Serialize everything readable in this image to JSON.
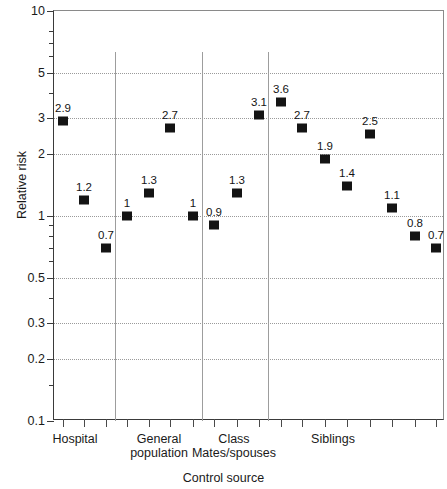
{
  "chart_data": {
    "type": "scatter",
    "title": "",
    "xlabel": "Control source",
    "ylabel": "Relative risk",
    "yscale": "log",
    "ylim": [
      0.1,
      10
    ],
    "yticks": [
      {
        "value": 10,
        "label": "10",
        "grid": false
      },
      {
        "value": 5,
        "label": "5",
        "grid": true
      },
      {
        "value": 3,
        "label": "3",
        "grid": true
      },
      {
        "value": 2,
        "label": "2",
        "grid": true
      },
      {
        "value": 1,
        "label": "1",
        "grid": true
      },
      {
        "value": 0.5,
        "label": "0.5",
        "grid": true
      },
      {
        "value": 0.3,
        "label": "0.3",
        "grid": true
      },
      {
        "value": 0.2,
        "label": "0.2",
        "grid": true
      },
      {
        "value": 0.1,
        "label": "0.1",
        "grid": false
      }
    ],
    "yminor_ticks": [
      8,
      7,
      6,
      4,
      0.9,
      0.8,
      0.7,
      0.6,
      0.4,
      0.15
    ],
    "grid": true,
    "legend": null,
    "groups": [
      {
        "name": "Hospital",
        "label": "Hospital",
        "n_points": 3,
        "label_x": 75,
        "boundary_x": 114
      },
      {
        "name": "General population",
        "label": "General\npopulation",
        "n_points": 3,
        "label_x": 159,
        "boundary_x": 201
      },
      {
        "name": "Class Mates/spouses",
        "label": "Class\nMates/spouses",
        "n_points": 3,
        "label_x": 234,
        "boundary_x": 267
      },
      {
        "name": "Siblings",
        "label": "Siblings",
        "n_points": 6,
        "label_x": 333,
        "boundary_x": null
      }
    ],
    "categories": [
      "Hospital",
      "Hospital",
      "Hospital",
      "General population",
      "General population",
      "General population",
      "Class Mates/spouses",
      "Class Mates/spouses",
      "Class Mates/spouses",
      "Siblings",
      "Siblings",
      "Siblings",
      "Siblings",
      "Siblings",
      "Siblings"
    ],
    "points": [
      {
        "group": "Hospital",
        "value": 2.9,
        "label": "2.9",
        "x": 62
      },
      {
        "group": "Hospital",
        "value": 1.2,
        "label": "1.2",
        "x": 83
      },
      {
        "group": "Hospital",
        "value": 0.7,
        "label": "0.7",
        "x": 105
      },
      {
        "group": "General population",
        "value": 1.0,
        "label": "1",
        "x": 126
      },
      {
        "group": "General population",
        "value": 1.3,
        "label": "1.3",
        "x": 148
      },
      {
        "group": "General population",
        "value": 2.7,
        "label": "2.7",
        "x": 169
      },
      {
        "group": "Class Mates/spouses",
        "value": 1.0,
        "label": "1",
        "x": 192
      },
      {
        "group": "Class Mates/spouses",
        "value": 0.9,
        "label": "0.9",
        "x": 213
      },
      {
        "group": "Class Mates/spouses",
        "value": 1.3,
        "label": "1.3",
        "x": 236
      },
      {
        "group": "Class Mates/spouses",
        "value": 3.1,
        "label": "3.1",
        "x": 258
      },
      {
        "group": "Siblings",
        "value": 3.6,
        "label": "3.6",
        "x": 280
      },
      {
        "group": "Siblings",
        "value": 2.7,
        "label": "2.7",
        "x": 301
      },
      {
        "group": "Siblings",
        "value": 1.9,
        "label": "1.9",
        "x": 324
      },
      {
        "group": "Siblings",
        "value": 1.4,
        "label": "1.4",
        "x": 346
      },
      {
        "group": "Siblings",
        "value": 2.5,
        "label": "2.5",
        "x": 369
      },
      {
        "group": "Siblings",
        "value": 1.1,
        "label": "1.1",
        "x": 391
      },
      {
        "group": "Siblings",
        "value": 0.8,
        "label": "0.8",
        "x": 414
      },
      {
        "group": "Siblings",
        "value": 0.7,
        "label": "0.7",
        "x": 435
      }
    ],
    "xtick_positions": [
      62,
      83,
      105,
      126,
      148,
      169,
      192,
      213,
      236,
      258,
      280,
      301,
      324,
      346,
      369,
      391,
      414,
      435
    ]
  }
}
